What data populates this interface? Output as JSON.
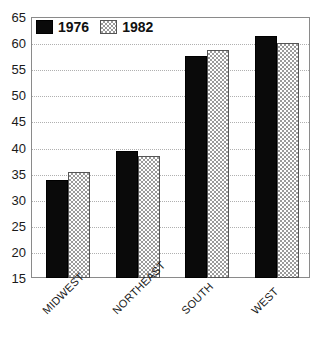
{
  "chart_data": {
    "type": "bar",
    "title": "",
    "subtitle": "",
    "xlabel": "",
    "ylabel": "",
    "categories": [
      "MIDWEST",
      "NORTHEAST",
      "SOUTH",
      "WEST"
    ],
    "series": [
      {
        "name": "1976",
        "values": [
          33.8,
          39.3,
          57.5,
          61.3
        ],
        "color": "#0a0a0a",
        "fill": "solid-black"
      },
      {
        "name": "1982",
        "values": [
          35.4,
          38.4,
          58.7,
          60.0
        ],
        "color": "#9a9a9a",
        "fill": "checkerboard"
      }
    ],
    "ylim": [
      15,
      65
    ],
    "ytick_step": 5,
    "yticks": [
      15,
      20,
      25,
      30,
      35,
      40,
      45,
      50,
      55,
      60,
      65
    ],
    "ytick_labels": [
      "15",
      "20",
      "25",
      "30",
      "35",
      "40",
      "45",
      "50",
      "55",
      "60",
      "65"
    ],
    "grid": true,
    "grid_style": "dotted",
    "grid_axis": "y",
    "legend_position": "top-left-inside",
    "xtick_label_rotation": -45,
    "frame": true
  },
  "legend": {
    "entries": [
      {
        "label": "1976",
        "swatch": "solid-black-swatch"
      },
      {
        "label": "1982",
        "swatch": "checkerboard-swatch"
      }
    ]
  },
  "colors": {
    "series_1976": "#0a0a0a",
    "series_1982": "#9a9a9a",
    "background": "#ffffff",
    "frame": "#8a8a8a",
    "gridline": "#b0b0b0",
    "text": "#1a1a1a"
  }
}
